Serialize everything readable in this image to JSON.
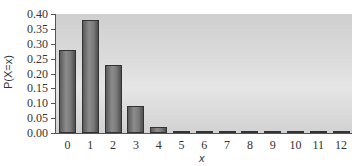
{
  "chart_data": {
    "type": "bar",
    "title": "",
    "xlabel": "x",
    "ylabel": "P(X=x)",
    "categories": [
      "0",
      "1",
      "2",
      "3",
      "4",
      "5",
      "6",
      "7",
      "8",
      "9",
      "10",
      "11",
      "12"
    ],
    "values": [
      0.28,
      0.38,
      0.23,
      0.09,
      0.02,
      0.002,
      0.001,
      0.0005,
      0.0002,
      0.0001,
      0.0,
      0.0,
      0.0
    ],
    "ylim": [
      0.0,
      0.4
    ],
    "yticks": [
      "0.00",
      "0.05",
      "0.10",
      "0.15",
      "0.20",
      "0.25",
      "0.30",
      "0.35",
      "0.40"
    ],
    "grid": false,
    "legend": null
  },
  "axis": {
    "y_title": "P(X=x)",
    "x_title": "x"
  }
}
